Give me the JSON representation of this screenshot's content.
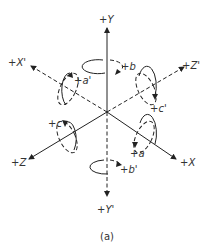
{
  "diagram": {
    "caption": "(a)",
    "origin": [
      107,
      112
    ],
    "axes": [
      {
        "id": "Y",
        "label": "+Y",
        "style": "solid",
        "end": [
          107,
          27
        ],
        "label_pos": [
          98,
          22
        ]
      },
      {
        "id": "Y_prime",
        "label": "+Y'",
        "style": "dashed",
        "end": [
          107,
          196
        ],
        "label_pos": [
          97,
          210
        ]
      },
      {
        "id": "X",
        "label": "+X",
        "style": "solid",
        "end": [
          176,
          159
        ],
        "label_pos": [
          180,
          166
        ]
      },
      {
        "id": "X_prime",
        "label": "+X'",
        "style": "dashed",
        "end": [
          31,
          66
        ],
        "label_pos": [
          8,
          66
        ]
      },
      {
        "id": "Z",
        "label": "+Z",
        "style": "solid",
        "end": [
          29,
          159
        ],
        "label_pos": [
          11,
          166
        ]
      },
      {
        "id": "Z_prime",
        "label": "+Z'",
        "style": "dashed",
        "end": [
          184,
          67
        ],
        "label_pos": [
          184,
          67
        ]
      }
    ],
    "rotations": [
      {
        "id": "b",
        "label": "+b",
        "axis": "Y",
        "label_pos": [
          121,
          69
        ]
      },
      {
        "id": "b_prime",
        "label": "+b'",
        "axis": "Y'",
        "label_pos": [
          121,
          173
        ]
      },
      {
        "id": "a",
        "label": "+a",
        "axis": "X",
        "label_pos": [
          130,
          157
        ]
      },
      {
        "id": "a_prime",
        "label": "+a'",
        "axis": "X'",
        "label_pos": [
          72,
          82
        ]
      },
      {
        "id": "c",
        "label": "+c",
        "axis": "Z",
        "label_pos": [
          49,
          124
        ]
      },
      {
        "id": "c_prime",
        "label": "+c'",
        "axis": "Z'",
        "label_pos": [
          152,
          110
        ]
      }
    ],
    "colors": {
      "line": "#222222",
      "text": "#333333",
      "background": "#ffffff"
    }
  }
}
